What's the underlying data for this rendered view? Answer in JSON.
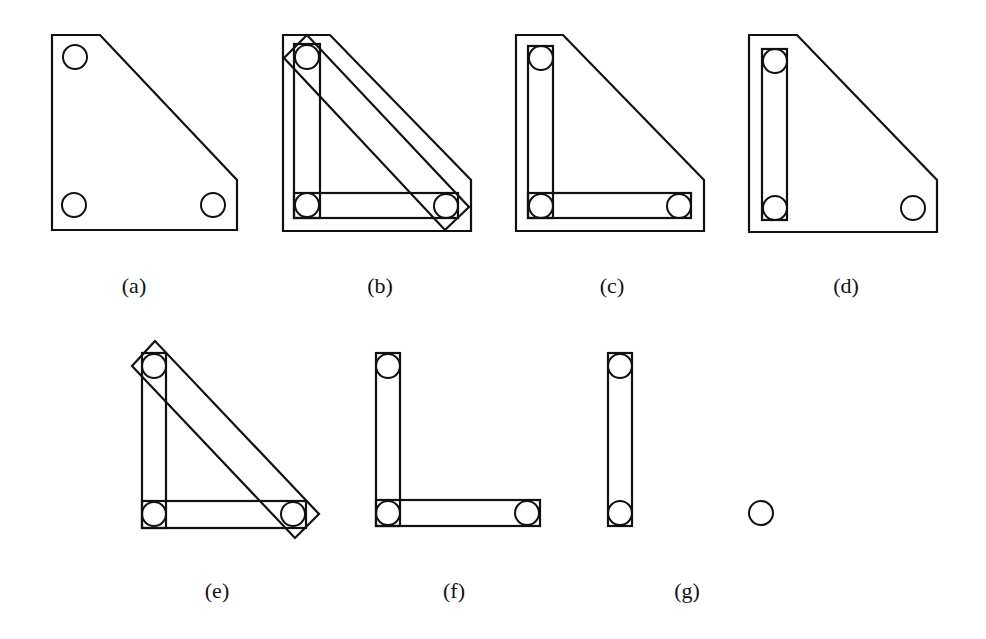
{
  "figure": {
    "colors": {
      "stroke": "#111111",
      "background": "#ffffff"
    },
    "hole_radius": 12,
    "panels": [
      {
        "id": "a",
        "label": "(a)",
        "label_pos": [
          134,
          273
        ],
        "plate": [
          [
            52,
            35
          ],
          [
            100,
            35
          ],
          [
            237,
            180
          ],
          [
            237,
            230
          ],
          [
            52,
            230
          ]
        ],
        "holes": [
          [
            75,
            57
          ],
          [
            74,
            205
          ],
          [
            213,
            205
          ]
        ],
        "rects": [],
        "polys": []
      },
      {
        "id": "b",
        "label": "(b)",
        "label_pos": [
          380,
          273
        ],
        "plate": [
          [
            283,
            35
          ],
          [
            330,
            35
          ],
          [
            471,
            180
          ],
          [
            471,
            231
          ],
          [
            283,
            231
          ]
        ],
        "holes": [
          [
            307,
            57
          ],
          [
            307,
            205
          ],
          [
            446,
            206
          ]
        ],
        "rects": [
          [
            294,
            44,
            26,
            174
          ],
          [
            294,
            193,
            164,
            25
          ]
        ],
        "polys": [
          [
            [
              307,
              35
            ],
            [
              284,
              58
            ],
            [
              445,
              230
            ],
            [
              469,
              207
            ]
          ]
        ]
      },
      {
        "id": "c",
        "label": "(c)",
        "label_pos": [
          612,
          273
        ],
        "plate": [
          [
            516,
            35
          ],
          [
            563,
            35
          ],
          [
            704,
            180
          ],
          [
            704,
            231
          ],
          [
            516,
            231
          ]
        ],
        "holes": [
          [
            541,
            58
          ],
          [
            541,
            206
          ],
          [
            679,
            206
          ]
        ],
        "rects": [
          [
            528,
            46,
            25,
            172
          ],
          [
            528,
            193,
            163,
            25
          ]
        ],
        "polys": []
      },
      {
        "id": "d",
        "label": "(d)",
        "label_pos": [
          846,
          273
        ],
        "plate": [
          [
            749,
            35
          ],
          [
            797,
            35
          ],
          [
            937,
            180
          ],
          [
            937,
            232
          ],
          [
            749,
            232
          ]
        ],
        "holes": [
          [
            775,
            61
          ],
          [
            775,
            208
          ],
          [
            913,
            208
          ]
        ],
        "rects": [
          [
            762,
            49,
            25,
            171
          ]
        ],
        "polys": []
      },
      {
        "id": "e",
        "label": "(e)",
        "label_pos": [
          217,
          578
        ],
        "plate": null,
        "holes": [
          [
            154,
            366
          ],
          [
            154,
            514
          ],
          [
            293,
            514
          ]
        ],
        "rects": [
          [
            142,
            353,
            24,
            175
          ],
          [
            142,
            501,
            164,
            27
          ]
        ],
        "polys": [
          [
            [
              155,
              341
            ],
            [
              132,
              366
            ],
            [
              295,
              538
            ],
            [
              319,
              514
            ]
          ]
        ]
      },
      {
        "id": "f",
        "label": "(f)",
        "label_pos": [
          454,
          578
        ],
        "plate": null,
        "holes": [
          [
            388,
            366
          ],
          [
            388,
            513
          ],
          [
            527,
            513
          ]
        ],
        "rects": [
          [
            376,
            353,
            24,
            173
          ],
          [
            376,
            500,
            164,
            26
          ]
        ],
        "polys": []
      },
      {
        "id": "g",
        "label": "(g)",
        "label_pos": [
          687,
          578
        ],
        "plate": null,
        "holes": [
          [
            620,
            366
          ],
          [
            620,
            513
          ],
          [
            761,
            513
          ]
        ],
        "rects": [
          [
            608,
            353,
            24,
            173
          ]
        ],
        "polys": []
      }
    ]
  }
}
